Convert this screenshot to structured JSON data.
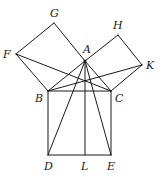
{
  "diagram": {
    "stroke_color": "#1a1a1a",
    "background": "#ffffff",
    "points": {
      "A": {
        "x": 85,
        "y": 61
      },
      "B": {
        "x": 48,
        "y": 91
      },
      "C": {
        "x": 111,
        "y": 91
      },
      "D": {
        "x": 48,
        "y": 155
      },
      "E": {
        "x": 111,
        "y": 155
      },
      "L": {
        "x": 85,
        "y": 155
      },
      "F": {
        "x": 16,
        "y": 54
      },
      "G": {
        "x": 54,
        "y": 23
      },
      "H": {
        "x": 118,
        "y": 35
      },
      "K": {
        "x": 142,
        "y": 65
      }
    },
    "labels": [
      {
        "text": "A",
        "x": 83,
        "y": 53
      },
      {
        "text": "B",
        "x": 35,
        "y": 102
      },
      {
        "text": "C",
        "x": 115,
        "y": 102
      },
      {
        "text": "D",
        "x": 44,
        "y": 170
      },
      {
        "text": "L",
        "x": 81,
        "y": 170
      },
      {
        "text": "E",
        "x": 107,
        "y": 170
      },
      {
        "text": "F",
        "x": 3,
        "y": 58
      },
      {
        "text": "G",
        "x": 50,
        "y": 17
      },
      {
        "text": "H",
        "x": 113,
        "y": 29
      },
      {
        "text": "K",
        "x": 146,
        "y": 69
      }
    ],
    "segments": [
      {
        "from": "A",
        "to": "B"
      },
      {
        "from": "A",
        "to": "C"
      },
      {
        "from": "B",
        "to": "C"
      },
      {
        "from": "B",
        "to": "D"
      },
      {
        "from": "D",
        "to": "E"
      },
      {
        "from": "E",
        "to": "C"
      },
      {
        "from": "B",
        "to": "F"
      },
      {
        "from": "F",
        "to": "G"
      },
      {
        "from": "G",
        "to": "A"
      },
      {
        "from": "A",
        "to": "H"
      },
      {
        "from": "H",
        "to": "K"
      },
      {
        "from": "K",
        "to": "C"
      },
      {
        "from": "F",
        "to": "C"
      },
      {
        "from": "B",
        "to": "K"
      },
      {
        "from": "A",
        "to": "D"
      },
      {
        "from": "A",
        "to": "E"
      },
      {
        "from": "A",
        "to": "L"
      }
    ]
  }
}
